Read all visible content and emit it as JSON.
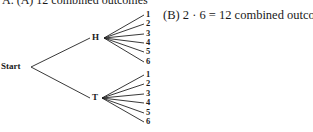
{
  "header": {
    "cut_text": "A. (A) 12 combined outcomes"
  },
  "caption": "(B) 2 · 6  =  12 combined outcomes",
  "tree": {
    "root": "Start",
    "branches": [
      {
        "label": "H",
        "outcomes": [
          "1",
          "2",
          "3",
          "4",
          "5",
          "6"
        ]
      },
      {
        "label": "T",
        "outcomes": [
          "1",
          "2",
          "3",
          "4",
          "5",
          "6"
        ]
      }
    ]
  }
}
